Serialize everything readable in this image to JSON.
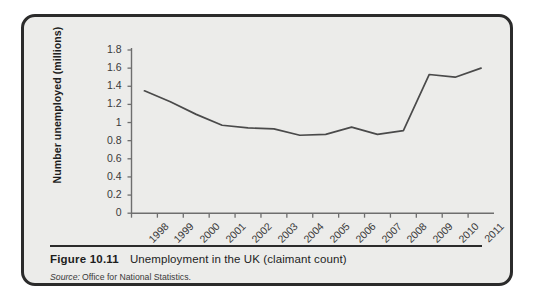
{
  "figure": {
    "caption_label": "Figure 10.11",
    "caption_text": "Unemployment in the UK (claimant count)",
    "source_label": "Source:",
    "source_text": "Office for National Statistics."
  },
  "style": {
    "border_color": "#2b2b2b",
    "panel_background": "#ececea",
    "line_color": "#4a4a4a",
    "axis_color": "#6e6e6e",
    "text_color": "#1d1d1d"
  },
  "chart_data": {
    "type": "line",
    "title": "Unemployment in the UK (claimant count)",
    "xlabel": "",
    "ylabel": "Number unemployed (millions)",
    "ylim": [
      0,
      1.8
    ],
    "xlim": [
      1998,
      2012
    ],
    "grid": false,
    "legend": "none",
    "ytick_labels": [
      "1.8",
      "1.6",
      "1.4",
      "1.2",
      "1",
      "0.8",
      "0.6",
      "0.4",
      "0.2",
      "0"
    ],
    "ytick_values": [
      1.8,
      1.6,
      1.4,
      1.2,
      1.0,
      0.8,
      0.6,
      0.4,
      0.2,
      0
    ],
    "categories": [
      "1998",
      "1999",
      "2000",
      "2001",
      "2002",
      "2003",
      "2004",
      "2005",
      "2006",
      "2007",
      "2008",
      "2009",
      "2010",
      "2011"
    ],
    "xtick_values": [
      1998,
      1999,
      2000,
      2001,
      2002,
      2003,
      2004,
      2005,
      2006,
      2007,
      2008,
      2009,
      2010,
      2011
    ],
    "series": [
      {
        "name": "Number unemployed (millions)",
        "x": [
          1998.5,
          1999.5,
          2000.5,
          2001.5,
          2002.5,
          2003.5,
          2004.5,
          2005.5,
          2006.5,
          2007.5,
          2008.5,
          2009.5,
          2010.5,
          2011.5
        ],
        "values": [
          1.35,
          1.23,
          1.09,
          0.97,
          0.94,
          0.93,
          0.86,
          0.87,
          0.95,
          0.87,
          0.91,
          1.53,
          1.5,
          1.6
        ]
      }
    ]
  }
}
